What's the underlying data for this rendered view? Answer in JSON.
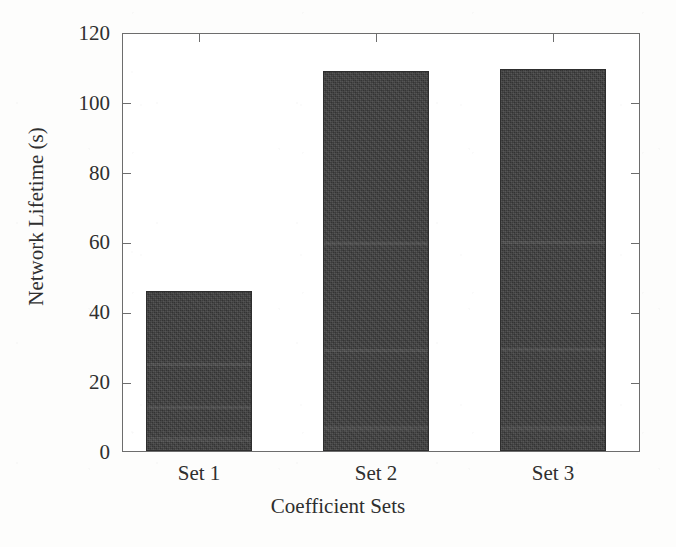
{
  "chart_data": {
    "type": "bar",
    "title": "",
    "xlabel": "Coefficient Sets",
    "ylabel": "Network Lifetime (s)",
    "categories": [
      "Set 1",
      "Set 2",
      "Set 3"
    ],
    "values": [
      46,
      109.5,
      110
    ],
    "ylim": [
      0,
      120
    ],
    "yticks": [
      0,
      20,
      40,
      60,
      80,
      100,
      120
    ],
    "ytick_labels": [
      "0",
      "20",
      "40",
      "60",
      "80",
      "100",
      "120"
    ],
    "grid": false,
    "legend": null,
    "legend_position": "none",
    "series": [
      {
        "name": "Network Lifetime",
        "values": [
          46,
          109.5,
          110
        ],
        "color": "#3b3b3b"
      }
    ],
    "bar_color": "#3b3b3b",
    "axis_color": "#6d6d6d",
    "background_color": "#ffffff"
  },
  "axes": {
    "y": {
      "ticks": [
        {
          "label": "120",
          "value": 120
        },
        {
          "label": "100",
          "value": 100
        },
        {
          "label": "80",
          "value": 80
        },
        {
          "label": "60",
          "value": 60
        },
        {
          "label": "40",
          "value": 40
        },
        {
          "label": "20",
          "value": 20
        },
        {
          "label": "0",
          "value": 0
        }
      ],
      "title": "Network Lifetime (s)"
    },
    "x": {
      "ticks": [
        {
          "label": "Set 1"
        },
        {
          "label": "Set 2"
        },
        {
          "label": "Set 3"
        }
      ],
      "title": "Coefficient Sets"
    }
  }
}
